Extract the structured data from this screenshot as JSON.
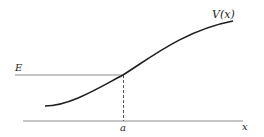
{
  "diagram": {
    "curve_label": "V(x)",
    "energy_label": "E",
    "turning_point_label": "a",
    "axis_label": "x",
    "colors": {
      "curve": "#1e1e1e",
      "lines": "#8c8c8c",
      "text": "#1e1e1e"
    }
  }
}
